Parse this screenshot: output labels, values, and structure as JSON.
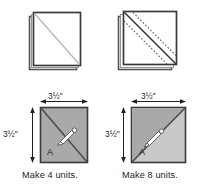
{
  "figure": {
    "colors": {
      "fabric_dark": "#a9a9a9",
      "fabric_light": "#c9c9c9",
      "outline": "#3a3a3a",
      "ink": "#231f20",
      "paper": "#ffffff",
      "draw_line": "#b5b5b5",
      "pin": "#ffffff"
    }
  },
  "panels": {
    "top_left": {
      "name": "stacked-squares-marked",
      "description": "Two squares stacked right sides together with a drawn diagonal line",
      "layer_count": 2,
      "diagonal": "drawn line corner to corner"
    },
    "top_right": {
      "name": "stacked-squares-stitched",
      "description": "Two squares stacked with a drawn diagonal and two stitched seam lines",
      "layer_count": 2,
      "stitch_lines": 2,
      "stitch_style": "dashed"
    },
    "bottom_left": {
      "name": "unit-a-four",
      "caption": "Make 4 units.",
      "width_label": "3½\"",
      "height_label": "3½\"",
      "unit_letter": "A",
      "fill": "#a9a9a9",
      "has_pin": true
    },
    "bottom_right": {
      "name": "unit-a-eight",
      "caption": "Make 8 units.",
      "width_label": "3½\"",
      "height_label": "3½\"",
      "unit_letter": "A",
      "fill_light": "#c9c9c9",
      "fill_dark": "#a9a9a9",
      "has_pin": true
    }
  }
}
